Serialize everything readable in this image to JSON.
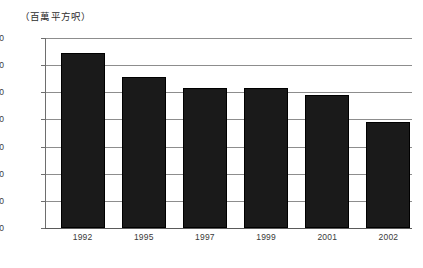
{
  "chart_data": {
    "type": "bar",
    "title": "（百萬平方呎）",
    "xlabel": "",
    "ylabel": "",
    "categories": [
      "1992",
      "1995",
      "1997",
      "1999",
      "2001",
      "2002"
    ],
    "values": [
      12.9,
      11.1,
      10.3,
      10.3,
      9.8,
      7.8
    ],
    "ylim": [
      0.0,
      14.0
    ],
    "ytick_labels": [
      "14.0",
      "12.0",
      "10.0",
      "8.0",
      "6.0",
      "4.0",
      "2.0",
      "0.0"
    ],
    "ytick_values": [
      14.0,
      12.0,
      10.0,
      8.0,
      6.0,
      4.0,
      2.0,
      0.0
    ],
    "grid": "horizontal",
    "legend": "none",
    "bar_color": "#1a1a1a",
    "gridline_color": "#8d8d8d",
    "axis_color": "#6e6e6e",
    "background_color": "#ffffff"
  }
}
